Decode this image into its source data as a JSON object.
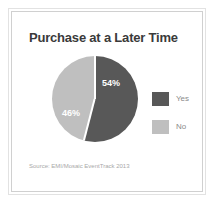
{
  "chart_data": {
    "type": "pie",
    "title": "Purchase at a Later Time",
    "categories": [
      "Yes",
      "No"
    ],
    "values": [
      54,
      46
    ],
    "labels": [
      "54%",
      "46%"
    ],
    "unit": "%",
    "colors": [
      "#585858",
      "#bfbfbf"
    ],
    "legend_position": "right",
    "start_angle_deg": 0,
    "direction": "clockwise",
    "grid": false,
    "source": "Source: EMI/Mosaic EventTrack 2013",
    "xlabel": "",
    "ylabel": ""
  },
  "legend": {
    "items": [
      {
        "label": "Yes",
        "color": "#585858"
      },
      {
        "label": "No",
        "color": "#bfbfbf"
      }
    ]
  },
  "theme": {
    "title_color": "#3a3a3a",
    "label_color": "#ffffff",
    "legend_text_color": "#8a8a8a",
    "source_color": "#a8a8a8",
    "frame_color": "#e2e2e2",
    "background": "#ffffff"
  }
}
